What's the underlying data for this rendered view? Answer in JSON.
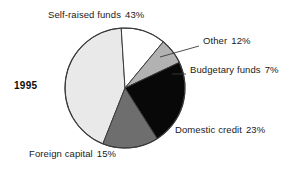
{
  "chart_data": {
    "type": "pie",
    "title": "",
    "subtitle": "",
    "xlabel": "",
    "ylabel": "",
    "legend_position": "none",
    "grid": false,
    "year_label": "1995",
    "value_unit": "%",
    "categories": [
      "Self-raised funds",
      "Other",
      "Budgetary funds",
      "Domestic credit",
      "Foreign capital"
    ],
    "values": [
      43,
      12,
      7,
      23,
      15
    ],
    "slices": [
      {
        "name": "Self-raised funds",
        "value": 43,
        "label": "Self-raised funds",
        "value_text": "43%",
        "color": "#e9e9e9",
        "start_angle": 201.6,
        "end_angle": 356.4
      },
      {
        "name": "Other",
        "value": 12,
        "label": "Other",
        "value_text": "12%",
        "color": "#ffffff",
        "start_angle": 356.4,
        "end_angle": 39.6
      },
      {
        "name": "Budgetary funds",
        "value": 7,
        "label": "Budgetary funds",
        "value_text": "7%",
        "color": "#b2b2b2",
        "start_angle": 39.6,
        "end_angle": 64.8
      },
      {
        "name": "Domestic credit",
        "value": 23,
        "label": "Domestic credit",
        "value_text": "23%",
        "color": "#080808",
        "start_angle": 64.8,
        "end_angle": 147.6
      },
      {
        "name": "Foreign capital",
        "value": 15,
        "label": "Foreign capital",
        "value_text": "15%",
        "color": "#6e6e6e",
        "start_angle": 147.6,
        "end_angle": 201.6
      }
    ],
    "outline_color": "#3a3a3a",
    "background_color": "#ffffff"
  }
}
